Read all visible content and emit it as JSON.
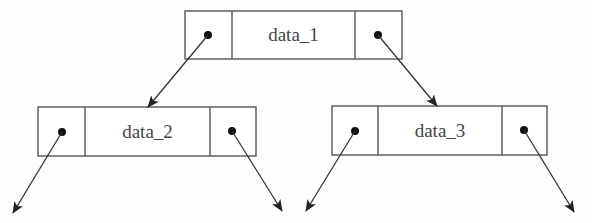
{
  "diagram": {
    "type": "binary-tree-node-structure",
    "colors": {
      "line": "#555555",
      "dot": "#111111",
      "text": "#444444",
      "background": "#fdfdfd"
    },
    "nodes": [
      {
        "id": "n1",
        "label": "data_1",
        "box": {
          "x": 185,
          "y": 11,
          "w": 217,
          "h": 48
        },
        "dividers": [
          232,
          355
        ],
        "left_dot": [
          208,
          35
        ],
        "right_dot": [
          378,
          35
        ]
      },
      {
        "id": "n2",
        "label": "data_2",
        "box": {
          "x": 38,
          "y": 107,
          "w": 218,
          "h": 49
        },
        "dividers": [
          85,
          210
        ],
        "left_dot": [
          62,
          132
        ],
        "right_dot": [
          232,
          131
        ]
      },
      {
        "id": "n3",
        "label": "data_3",
        "box": {
          "x": 332,
          "y": 106,
          "w": 215,
          "h": 49
        },
        "dividers": [
          378,
          502
        ],
        "left_dot": [
          355,
          131
        ],
        "right_dot": [
          524,
          130
        ]
      }
    ],
    "edges": [
      {
        "from": "n1.left",
        "x1": 208,
        "y1": 35,
        "x2": 148,
        "y2": 107
      },
      {
        "from": "n1.right",
        "x1": 378,
        "y1": 35,
        "x2": 437,
        "y2": 106
      },
      {
        "from": "n2.left",
        "x1": 62,
        "y1": 132,
        "x2": 13,
        "y2": 213
      },
      {
        "from": "n2.right",
        "x1": 232,
        "y1": 131,
        "x2": 282,
        "y2": 211
      },
      {
        "from": "n3.left",
        "x1": 355,
        "y1": 131,
        "x2": 306,
        "y2": 211
      },
      {
        "from": "n3.right",
        "x1": 524,
        "y1": 130,
        "x2": 574,
        "y2": 212
      }
    ]
  }
}
